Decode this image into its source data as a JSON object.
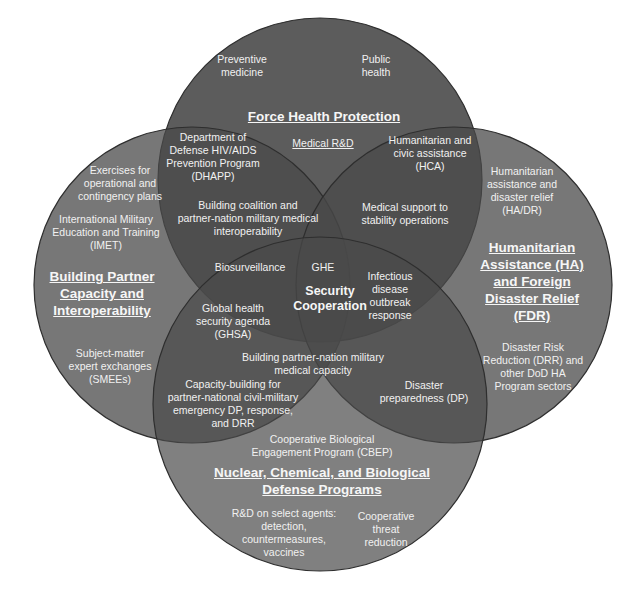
{
  "colors": {
    "background": "#ffffff",
    "circle_fill": "#555555",
    "circle_stroke": "#333333",
    "text": "#f1f1f1"
  },
  "circles": {
    "top": {
      "title": "Force Health Protection",
      "items": [
        "Preventive medicine",
        "Public health",
        "Medical R&D"
      ]
    },
    "left": {
      "title": "Building Partner Capacity and Interoperability",
      "items": [
        "Exercises for operational and contingency plans",
        "International Military Education and Training (IMET)",
        "Subject-matter expert exchanges (SMEEs)"
      ]
    },
    "right": {
      "title": "Humanitarian Assistance (HA) and Foreign Disaster Relief (FDR)",
      "items": [
        "Humanitarian assistance and disaster relief (HA/DR)",
        "Disaster Risk Reduction (DRR) and other DoD HA Program sectors"
      ]
    },
    "bottom": {
      "title": "Nuclear, Chemical, and Biological Defense Programs",
      "items": [
        "Cooperative Biological Engagement Program (CBEP)",
        "R&D on select agents: detection, countermeasures, vaccines",
        "Cooperative threat reduction"
      ]
    }
  },
  "center": {
    "title": "Security Cooperation"
  },
  "labels": {
    "preventive_1": "Preventive",
    "preventive_2": "medicine",
    "public_1": "Public",
    "public_2": "health",
    "fhp_title": "Force Health Protection",
    "medical_rd": "Medical R&D",
    "dhapp_1": "Department of",
    "dhapp_2": "Defense HIV/AIDS",
    "dhapp_3": "Prevention Program",
    "dhapp_4": "(DHAPP)",
    "hca_1": "Humanitarian and",
    "hca_2": "civic assistance",
    "hca_3": "(HCA)",
    "exercises_1": "Exercises for",
    "exercises_2": "operational and",
    "exercises_3": "contingency plans",
    "imet_1": "International Military",
    "imet_2": "Education and Training",
    "imet_3": "(IMET)",
    "coalition_1": "Building coalition and",
    "coalition_2": "partner-nation military medical",
    "coalition_3": "interoperability",
    "stability_1": "Medical support to",
    "stability_2": "stability operations",
    "hadr_1": "Humanitarian",
    "hadr_2": "assistance and",
    "hadr_3": "disaster relief",
    "hadr_4": "(HA/DR)",
    "bpc_title_1": "Building Partner",
    "bpc_title_2": "Capacity and",
    "bpc_title_3": "Interoperability",
    "biosurveillance": "Biosurveillance",
    "ghe": "GHE",
    "infectious_1": "Infectious",
    "infectious_2": "disease",
    "infectious_3": "outbreak",
    "infectious_4": "response",
    "sc_1": "Security",
    "sc_2": "Cooperation",
    "ha_title_1": "Humanitarian",
    "ha_title_2": "Assistance (HA)",
    "ha_title_3": "and Foreign",
    "ha_title_4": "Disaster Relief",
    "ha_title_5": "(FDR)",
    "ghsa_1": "Global health",
    "ghsa_2": "security agenda",
    "ghsa_3": "(GHSA)",
    "smee_1": "Subject-matter",
    "smee_2": "expert exchanges",
    "smee_3": "(SMEEs)",
    "bpn_1": "Building partner-nation military",
    "bpn_2": "medical capacity",
    "drr_1": "Disaster Risk",
    "drr_2": "Reduction (DRR) and",
    "drr_3": "other DoD HA",
    "drr_4": "Program sectors",
    "capacity_1": "Capacity-building for",
    "capacity_2": "partner-national civil-military",
    "capacity_3": "emergency DP, response,",
    "capacity_4": "and DRR",
    "dp_1": "Disaster",
    "dp_2": "preparedness (DP)",
    "cbep_1": "Cooperative Biological",
    "cbep_2": "Engagement Program (CBEP)",
    "ncb_title_1": "Nuclear, Chemical, and Biological",
    "ncb_title_2": "Defense Programs",
    "rd_1": "R&D on select agents:",
    "rd_2": "detection,",
    "rd_3": "countermeasures,",
    "rd_4": "vaccines",
    "ctr_1": "Cooperative",
    "ctr_2": "threat",
    "ctr_3": "reduction"
  }
}
